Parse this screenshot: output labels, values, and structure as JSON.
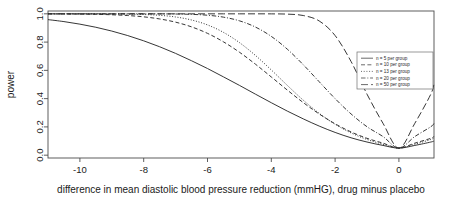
{
  "chart_data": {
    "type": "line",
    "title": "",
    "xlabel": "difference in mean diastolic blood pressure reduction (mmHG), drug minus placebo",
    "ylabel": "power",
    "xlim": [
      -11.0,
      1.1
    ],
    "ylim": [
      -0.02,
      1.02
    ],
    "xticks": [
      -10,
      -8,
      -6,
      -4,
      -2,
      0
    ],
    "xticklabels": [
      "-10",
      "-8",
      "-6",
      "-4",
      "-2",
      "0"
    ],
    "yticks": [
      0.0,
      0.2,
      0.4,
      0.6,
      0.8,
      1.0
    ],
    "yticklabels": [
      "0.0",
      "0.2",
      "0.4",
      "0.6",
      "0.8",
      "1.0"
    ],
    "grid": false,
    "legend_position": "right",
    "x": [
      -11.0,
      -10.5,
      -10.0,
      -9.5,
      -9.0,
      -8.5,
      -8.0,
      -7.5,
      -7.0,
      -6.5,
      -6.0,
      -5.5,
      -5.0,
      -4.5,
      -4.0,
      -3.5,
      -3.0,
      -2.5,
      -2.0,
      -1.5,
      -1.0,
      -0.5,
      0.0,
      0.5,
      1.0,
      1.1
    ],
    "series": [
      {
        "name": "n = 5 per group",
        "dash": "solid",
        "values": [
          0.959,
          0.945,
          0.927,
          0.905,
          0.878,
          0.846,
          0.809,
          0.767,
          0.72,
          0.668,
          0.613,
          0.554,
          0.494,
          0.432,
          0.371,
          0.312,
          0.257,
          0.206,
          0.161,
          0.123,
          0.093,
          0.069,
          0.05,
          0.069,
          0.093,
          0.1
        ]
      },
      {
        "name": "n = 10 per group",
        "dash": "dashed",
        "values": [
          0.9996,
          0.9991,
          0.9982,
          0.9965,
          0.9934,
          0.9879,
          0.9787,
          0.9638,
          0.941,
          0.9077,
          0.8618,
          0.8019,
          0.7285,
          0.6442,
          0.5533,
          0.4609,
          0.3724,
          0.2918,
          0.2219,
          0.1645,
          0.1194,
          0.0852,
          0.05,
          0.0852,
          0.1194,
          0.133
        ]
      },
      {
        "name": "n = 13 per group",
        "dash": "dotted",
        "values": [
          0.99997,
          0.99993,
          0.99984,
          0.99962,
          0.9991,
          0.9979,
          0.9952,
          0.9894,
          0.9777,
          0.9564,
          0.9215,
          0.8689,
          0.7967,
          0.7062,
          0.6028,
          0.4942,
          0.3894,
          0.2962,
          0.2188,
          0.1576,
          0.1111,
          0.0774,
          0.05,
          0.0774,
          0.1111,
          0.1226
        ]
      },
      {
        "name": "n = 20 per group",
        "dash": "dashdot",
        "values": [
          1.0,
          1.0,
          1.0,
          1.0,
          0.99999,
          0.99998,
          0.99991,
          0.99965,
          0.99878,
          0.99633,
          0.9901,
          0.9765,
          0.9506,
          0.9067,
          0.8403,
          0.7501,
          0.6402,
          0.5198,
          0.4001,
          0.2918,
          0.2012,
          0.132,
          0.05,
          0.132,
          0.2012,
          0.225
        ]
      },
      {
        "name": "n = 50 per group",
        "dash": "longdash",
        "values": [
          1.0,
          1.0,
          1.0,
          1.0,
          1.0,
          1.0,
          1.0,
          1.0,
          1.0,
          1.0,
          1.0,
          1.0,
          0.99999,
          0.99996,
          0.9997,
          0.9979,
          0.9881,
          0.9497,
          0.8462,
          0.6629,
          0.4315,
          0.2259,
          0.05,
          0.2259,
          0.4315,
          0.508
        ]
      }
    ]
  },
  "legend": {
    "entries": [
      {
        "label": "n = 5 per group"
      },
      {
        "label": "n = 10 per group"
      },
      {
        "label": "n = 13 per group"
      },
      {
        "label": "n = 20 per group"
      },
      {
        "label": "n = 50 per group"
      }
    ]
  }
}
